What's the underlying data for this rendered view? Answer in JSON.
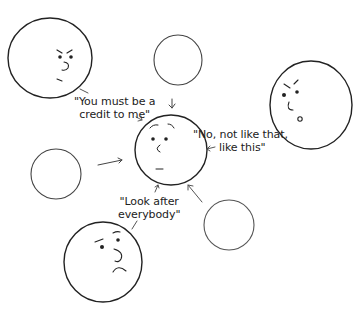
{
  "diagram": {
    "type": "hand-drawn social influence diagram",
    "colors": {
      "stroke": "#222222",
      "light_stroke": "#555555",
      "background": "#ffffff"
    },
    "faces": [
      {
        "id": "top-left-face",
        "expression": "stern",
        "has_face": true
      },
      {
        "id": "top-center-circle",
        "expression": "blank",
        "has_face": false
      },
      {
        "id": "right-face",
        "expression": "disapproving",
        "has_face": true
      },
      {
        "id": "center-face",
        "expression": "neutral-worried",
        "has_face": true
      },
      {
        "id": "left-circle",
        "expression": "blank",
        "has_face": false
      },
      {
        "id": "bottom-right-circle",
        "expression": "blank",
        "has_face": false
      },
      {
        "id": "bottom-face",
        "expression": "sad-worried",
        "has_face": true
      }
    ],
    "captions": {
      "credit": {
        "line1": "\"You must be a",
        "line2": "credit to me\""
      },
      "not_like_that": {
        "line1": "\"No, not like that,",
        "line2": "like this\""
      },
      "look_after": {
        "line1": "\"Look after",
        "line2": "everybody\""
      }
    },
    "arrows": [
      {
        "from": "top-center-circle",
        "to": "center-face"
      },
      {
        "from": "left-circle",
        "to": "center-face"
      },
      {
        "from": "bottom-right-circle",
        "to": "center-face"
      },
      {
        "from": "caption-not-like-that",
        "to": "center-face"
      },
      {
        "from": "caption-look-after",
        "to": "center-face"
      },
      {
        "from": "caption-credit",
        "to": "center-face"
      }
    ]
  }
}
